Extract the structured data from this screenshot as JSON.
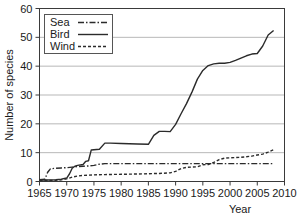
{
  "chart_data": {
    "type": "line",
    "title": "",
    "xlabel": "Year",
    "ylabel": "Number of species",
    "xlim": [
      1965,
      2010
    ],
    "ylim": [
      0,
      60
    ],
    "xticks": [
      1965,
      1970,
      1975,
      1980,
      1985,
      1990,
      1995,
      2000,
      2005,
      2010
    ],
    "yticks": [
      0,
      10,
      20,
      30,
      40,
      50,
      60
    ],
    "grid": "horizontal",
    "legend_position": "top-left",
    "series": [
      {
        "name": "Sea",
        "style": "dash-dot",
        "x": [
          1965,
          1966,
          1966.5,
          1967,
          1968,
          1969,
          1970,
          1971,
          1972,
          1973,
          1974,
          1975,
          1976,
          1977,
          1978,
          1980,
          1985,
          1990,
          1993,
          1995,
          1997,
          2000,
          2003,
          2005,
          2008
        ],
        "y": [
          0.6,
          0.8,
          3.2,
          4.4,
          4.6,
          4.7,
          4.8,
          5.0,
          5.2,
          5.3,
          5.4,
          5.6,
          6.0,
          6.2,
          6.2,
          6.2,
          6.2,
          6.2,
          6.2,
          6.2,
          6.2,
          6.2,
          6.2,
          6.2,
          6.2
        ]
      },
      {
        "name": "Bird",
        "style": "solid",
        "x": [
          1965,
          1967,
          1968,
          1969,
          1970,
          1970.5,
          1971,
          1971.5,
          1972,
          1973,
          1973.5,
          1974,
          1974.5,
          1975,
          1976,
          1977,
          1978,
          1980,
          1983,
          1985,
          1986,
          1987,
          1988,
          1989,
          1990,
          1991,
          1992,
          1993,
          1994,
          1995,
          1996,
          1997,
          1998,
          1999,
          2000,
          2001,
          2002,
          2003,
          2004,
          2005,
          2006,
          2007,
          2008
        ],
        "y": [
          0.5,
          0.5,
          0.6,
          0.8,
          1.2,
          2.6,
          4.6,
          5.3,
          5.6,
          5.9,
          7.0,
          7.2,
          10.9,
          11.0,
          11.2,
          13.3,
          13.3,
          13.2,
          13.0,
          12.9,
          16.0,
          17.4,
          17.4,
          17.3,
          19.8,
          23.5,
          27.0,
          31.0,
          35.5,
          38.5,
          40.2,
          40.8,
          41.0,
          41.0,
          41.3,
          42.0,
          42.8,
          43.6,
          44.2,
          44.4,
          47.0,
          50.8,
          52.4
        ]
      },
      {
        "name": "Wind",
        "style": "dotted",
        "x": [
          1965,
          1968,
          1969,
          1970,
          1971,
          1972,
          1973,
          1974,
          1975,
          1977,
          1980,
          1983,
          1985,
          1987,
          1989,
          1990,
          1991,
          1992,
          1993,
          1994,
          1995,
          1996,
          1997,
          1998,
          1999,
          2000,
          2001,
          2002,
          2003,
          2004,
          2005,
          2006,
          2007,
          2008
        ],
        "y": [
          0.3,
          0.4,
          0.6,
          0.9,
          1.5,
          1.9,
          2.1,
          2.2,
          2.3,
          2.4,
          2.5,
          2.6,
          2.7,
          2.8,
          3.0,
          3.5,
          4.5,
          4.9,
          5.0,
          5.1,
          5.8,
          5.9,
          6.6,
          7.6,
          8.1,
          8.2,
          8.3,
          8.4,
          8.6,
          8.8,
          9.2,
          9.5,
          10.2,
          11.0
        ]
      }
    ]
  },
  "legend": {
    "items": [
      {
        "label": "Sea"
      },
      {
        "label": "Bird"
      },
      {
        "label": "Wind"
      }
    ]
  },
  "axes": {
    "y_title": "Number of species",
    "x_title": "Year",
    "y_tick_labels": [
      "0",
      "10",
      "20",
      "30",
      "40",
      "50",
      "60"
    ],
    "x_tick_labels": [
      "1965",
      "1970",
      "1975",
      "1980",
      "1985",
      "1990",
      "1995",
      "2000",
      "2005",
      "2010"
    ]
  },
  "colors": {
    "line": "#2b2b2b",
    "grid": "#9a9a9a",
    "frame": "#3a3a3a",
    "background": "#ffffff"
  }
}
